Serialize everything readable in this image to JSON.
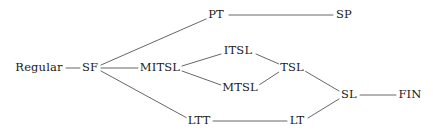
{
  "diagram": {
    "type": "node-link-graph",
    "canvas": {
      "width": 439,
      "height": 135
    },
    "style": {
      "background_color": "#ffffff",
      "edge_color": "#555555",
      "text_color": "#1a1a1a",
      "edge_width": 0.9,
      "font_size_px": 11.5
    },
    "nodes": [
      {
        "id": "regular",
        "label": "Regular",
        "x": 39,
        "y": 68,
        "half_w": 23,
        "half_h": 7
      },
      {
        "id": "sf",
        "label": "SF",
        "x": 90,
        "y": 68,
        "half_w": 8,
        "half_h": 7
      },
      {
        "id": "pt",
        "label": "PT",
        "x": 216,
        "y": 15,
        "half_w": 8,
        "half_h": 7
      },
      {
        "id": "sp",
        "label": "SP",
        "x": 344,
        "y": 15,
        "half_w": 8,
        "half_h": 7
      },
      {
        "id": "mitsl",
        "label": "MITSL",
        "x": 160,
        "y": 68,
        "half_w": 20,
        "half_h": 7
      },
      {
        "id": "itsl",
        "label": "ITSL",
        "x": 238,
        "y": 51,
        "half_w": 15,
        "half_h": 7
      },
      {
        "id": "mtsl",
        "label": "MTSL",
        "x": 240,
        "y": 88,
        "half_w": 17,
        "half_h": 7
      },
      {
        "id": "tsl",
        "label": "TSL",
        "x": 292,
        "y": 68,
        "half_w": 12,
        "half_h": 7
      },
      {
        "id": "ltt",
        "label": "LTT",
        "x": 199,
        "y": 121,
        "half_w": 11,
        "half_h": 7
      },
      {
        "id": "lt",
        "label": "LT",
        "x": 297,
        "y": 121,
        "half_w": 8,
        "half_h": 7
      },
      {
        "id": "sl",
        "label": "SL",
        "x": 349,
        "y": 95,
        "half_w": 8,
        "half_h": 7
      },
      {
        "id": "fin",
        "label": "FIN",
        "x": 410,
        "y": 95,
        "half_w": 11,
        "half_h": 7
      }
    ],
    "edges": [
      {
        "id": "regular-sf",
        "from": "regular",
        "to": "sf",
        "x1": 66,
        "y1": 68,
        "x2": 80,
        "y2": 68
      },
      {
        "id": "sf-pt",
        "from": "sf",
        "to": "pt",
        "x1": 101,
        "y1": 65,
        "x2": 206,
        "y2": 19
      },
      {
        "id": "sf-mitsl",
        "from": "sf",
        "to": "mitsl",
        "x1": 101,
        "y1": 68,
        "x2": 138,
        "y2": 68
      },
      {
        "id": "sf-ltt",
        "from": "sf",
        "to": "ltt",
        "x1": 101,
        "y1": 71,
        "x2": 187,
        "y2": 118
      },
      {
        "id": "pt-sp",
        "from": "pt",
        "to": "sp",
        "x1": 229,
        "y1": 15,
        "x2": 333,
        "y2": 15
      },
      {
        "id": "mitsl-itsl",
        "from": "mitsl",
        "to": "itsl",
        "x1": 182,
        "y1": 66,
        "x2": 221,
        "y2": 54
      },
      {
        "id": "mitsl-mtsl",
        "from": "mitsl",
        "to": "mtsl",
        "x1": 182,
        "y1": 71,
        "x2": 221,
        "y2": 85
      },
      {
        "id": "itsl-tsl",
        "from": "itsl",
        "to": "tsl",
        "x1": 256,
        "y1": 54,
        "x2": 279,
        "y2": 64
      },
      {
        "id": "mtsl-tsl",
        "from": "mtsl",
        "to": "tsl",
        "x1": 259,
        "y1": 85,
        "x2": 279,
        "y2": 72
      },
      {
        "id": "ltt-lt",
        "from": "ltt",
        "to": "lt",
        "x1": 213,
        "y1": 121,
        "x2": 287,
        "y2": 121
      },
      {
        "id": "tsl-sl",
        "from": "tsl",
        "to": "sl",
        "x1": 305,
        "y1": 71,
        "x2": 339,
        "y2": 91
      },
      {
        "id": "lt-sl",
        "from": "lt",
        "to": "sl",
        "x1": 308,
        "y1": 118,
        "x2": 339,
        "y2": 99
      },
      {
        "id": "sl-fin",
        "from": "sl",
        "to": "fin",
        "x1": 360,
        "y1": 95,
        "x2": 396,
        "y2": 95
      }
    ]
  }
}
